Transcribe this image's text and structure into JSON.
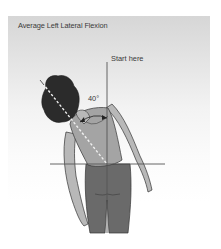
{
  "diagram": {
    "title": "Average Left Lateral Flexion",
    "start_label": "Start here",
    "angle_label": "40°",
    "angle_degrees": 40,
    "colors": {
      "panel_top": "#d6d6d6",
      "panel_bottom": "#ffffff",
      "text": "#3a3a3a",
      "hair": "#2b2b2b",
      "skin": "#b8b8b8",
      "top": "#a4a4a4",
      "pants": "#6a6a6a",
      "reference_line": "#555555",
      "spine_line": "#f0f0f0"
    }
  }
}
